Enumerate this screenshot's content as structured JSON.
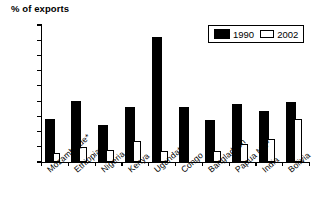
{
  "chart_data": {
    "type": "bar",
    "title": "",
    "ylabel": "% of exports",
    "xlabel": "",
    "ylim": [
      0,
      90
    ],
    "ytick_step": 10,
    "yticks": [
      0,
      10,
      20,
      30,
      40,
      50,
      60,
      70,
      80,
      90
    ],
    "grid": false,
    "legend_position": "top-right",
    "categories": [
      "Mozambique*",
      "Ethiopia*",
      "Nigeria",
      "Kenya",
      "Uganda*",
      "Congo",
      "Bangladesh",
      "Papua NG*",
      "India",
      "Bolivia"
    ],
    "series": [
      {
        "name": "1990",
        "color": "#000000",
        "values": [
          27,
          39,
          23,
          35,
          81,
          35,
          26,
          37,
          32,
          38
        ]
      },
      {
        "name": "2002",
        "color": "#ffffff",
        "values": [
          6,
          10,
          8,
          14,
          7,
          0,
          7,
          12,
          15,
          28
        ]
      }
    ]
  },
  "legend": {
    "entries": [
      {
        "label": "1990",
        "swatch": "filled-black-swatch"
      },
      {
        "label": "2002",
        "swatch": "outlined-white-swatch"
      }
    ]
  }
}
